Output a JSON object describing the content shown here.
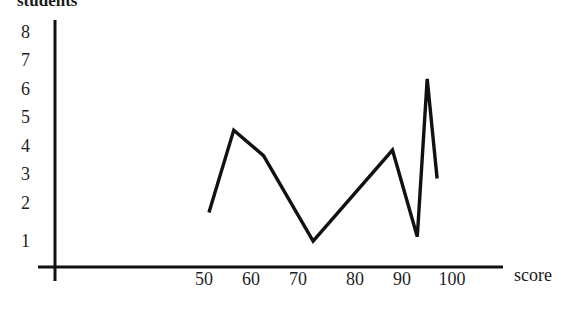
{
  "chart_data": {
    "type": "line",
    "title": "",
    "xlabel": "score",
    "ylabel": "students",
    "xlim": [
      40,
      103
    ],
    "ylim": [
      0,
      8.6
    ],
    "grid": false,
    "legend": null,
    "x_ticks": [
      50,
      60,
      70,
      80,
      90,
      100
    ],
    "x_tick_labels": [
      "50",
      "60",
      "70",
      "80",
      "90",
      "100"
    ],
    "y_ticks": [
      1,
      2,
      3,
      4,
      5,
      6,
      7,
      8
    ],
    "y_tick_labels": [
      "1",
      "2",
      "3",
      "4",
      "5",
      "6",
      "7",
      "8"
    ],
    "series": [
      {
        "name": "students",
        "x": [
          51,
          56,
          62,
          72,
          88,
          93,
          95,
          97
        ],
        "values": [
          2.0,
          4.9,
          4.0,
          1.0,
          4.2,
          1.15,
          6.7,
          3.2
        ]
      }
    ],
    "line_color": "#111111",
    "line_width": 3.4
  },
  "axes": {
    "y_title": "students",
    "x_title": "score",
    "y_tick_labels": [
      "8",
      "7",
      "6",
      "5",
      "4",
      "3",
      "2",
      "1"
    ],
    "x_tick_labels": [
      "50",
      "60",
      "70",
      "80",
      "90",
      "100"
    ]
  }
}
